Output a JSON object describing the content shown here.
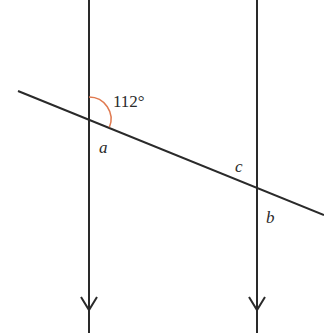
{
  "diagram": {
    "type": "parallel-lines-transversal",
    "angle_label": "112°",
    "labels": {
      "a": "a",
      "b": "b",
      "c": "c"
    },
    "colors": {
      "line": "#2a2a2a",
      "arc": "#e07a50",
      "background": "#ffffff"
    },
    "parallel_lines": [
      {
        "name": "left-parallel-line",
        "x": 89,
        "arrow_y": 303
      },
      {
        "name": "right-parallel-line",
        "x": 257,
        "arrow_y": 303
      }
    ],
    "transversal": {
      "x1": 18,
      "y1": 91,
      "x2": 324,
      "y2": 215
    }
  }
}
